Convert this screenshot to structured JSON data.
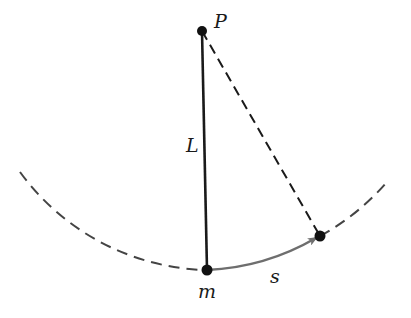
{
  "diagram": {
    "labels": {
      "pivot": "P",
      "length": "L",
      "mass": "m",
      "arc_length": "s"
    },
    "colors": {
      "ink": "#1a1a1a",
      "dashed_arc": "#444444",
      "arrow": "#6e6e6e"
    },
    "points": {
      "pivot": [
        202,
        31
      ],
      "mass_rest": [
        207,
        270
      ],
      "mass_displaced": [
        320,
        236
      ]
    }
  }
}
